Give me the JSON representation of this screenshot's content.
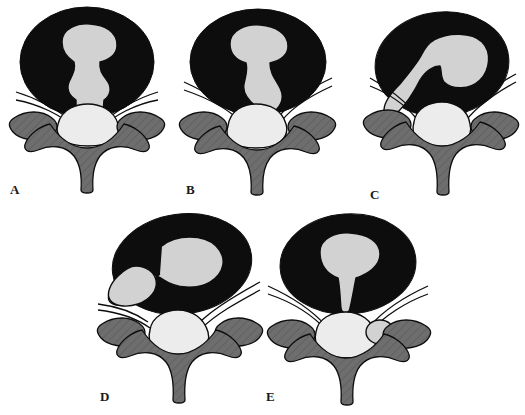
{
  "figure": {
    "background_color": "#ffffff",
    "width": 525,
    "height": 415
  },
  "palette": {
    "annulus_fibrosus": "#0d0d0d",
    "nucleus_pulposus": "#d2d2d2",
    "vertebral_bone": "#6e6e6e",
    "thecal_sac": "#ececec",
    "outline": "#0d0d0d",
    "background": "#ffffff",
    "label_color": "#1a1a1a"
  },
  "panels": [
    {
      "id": "A",
      "label": "A",
      "label_x": 10,
      "label_y": 183,
      "origin_x": 0,
      "origin_y": 0,
      "description": "Normal disc with central nucleus pulposus",
      "herniation_stage": "normal"
    },
    {
      "id": "B",
      "label": "B",
      "label_x": 186,
      "label_y": 183,
      "origin_x": 170,
      "origin_y": 0,
      "description": "Central posterior protrusion of nucleus pulposus",
      "herniation_stage": "protrusion"
    },
    {
      "id": "C",
      "label": "C",
      "label_x": 370,
      "label_y": 188,
      "origin_x": 348,
      "origin_y": 4,
      "description": "Posterolateral protrusion displacing nerve root",
      "herniation_stage": "posterolateral-protrusion"
    },
    {
      "id": "D",
      "label": "D",
      "label_x": 100,
      "label_y": 390,
      "origin_x": 88,
      "origin_y": 208,
      "description": "Far lateral extrusion through annulus",
      "herniation_stage": "extrusion"
    },
    {
      "id": "E",
      "label": "E",
      "label_x": 266,
      "label_y": 390,
      "origin_x": 258,
      "origin_y": 208,
      "description": "Sequestration with free disc fragment in canal",
      "herniation_stage": "sequestration"
    }
  ]
}
